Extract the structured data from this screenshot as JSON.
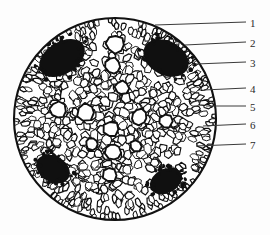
{
  "figure": {
    "kind": "botanical-cross-section",
    "background_color": "#fdfdfd",
    "ink_color": "#111111",
    "cell_fill_color": "#ffffff",
    "patch_fill_color": "#101010",
    "outline": {
      "center_x": 115,
      "center_y": 119,
      "radius": 101
    }
  },
  "labels": [
    {
      "id": "1",
      "text": "1",
      "text_x": 250,
      "text_y": 18,
      "leader_x1": 155,
      "leader_y1": 25,
      "leader_x2": 246,
      "leader_y2": 22
    },
    {
      "id": "2",
      "text": "2",
      "text_x": 250,
      "text_y": 38,
      "leader_x1": 185,
      "leader_y1": 45,
      "leader_x2": 246,
      "leader_y2": 42
    },
    {
      "id": "3",
      "text": "3",
      "text_x": 250,
      "text_y": 58,
      "leader_x1": 196,
      "leader_y1": 64,
      "leader_x2": 246,
      "leader_y2": 62
    },
    {
      "id": "4",
      "text": "4",
      "text_x": 250,
      "text_y": 84,
      "leader_x1": 204,
      "leader_y1": 90,
      "leader_x2": 246,
      "leader_y2": 88
    },
    {
      "id": "5",
      "text": "5",
      "text_x": 250,
      "text_y": 102,
      "leader_x1": 206,
      "leader_y1": 106,
      "leader_x2": 246,
      "leader_y2": 106
    },
    {
      "id": "6",
      "text": "6",
      "text_x": 250,
      "text_y": 120,
      "leader_x1": 203,
      "leader_y1": 126,
      "leader_x2": 246,
      "leader_y2": 124
    },
    {
      "id": "7",
      "text": "7",
      "text_x": 250,
      "text_y": 140,
      "leader_x1": 196,
      "leader_y1": 146,
      "leader_x2": 246,
      "leader_y2": 144
    }
  ],
  "dark_patches": [
    {
      "name": "sclerenchyma-patch-top-left",
      "cx": 62,
      "cy": 58,
      "rx": 25,
      "ry": 16,
      "rotate": -32
    },
    {
      "name": "sclerenchyma-patch-top-right",
      "cx": 166,
      "cy": 58,
      "rx": 24,
      "ry": 17,
      "rotate": 28
    },
    {
      "name": "sclerenchyma-patch-bottom-left",
      "cx": 53,
      "cy": 169,
      "rx": 18,
      "ry": 13,
      "rotate": 30
    },
    {
      "name": "sclerenchyma-patch-bottom-right",
      "cx": 166,
      "cy": 181,
      "rx": 17,
      "ry": 12,
      "rotate": -28
    }
  ],
  "cell_zones": [
    {
      "name": "epidermis-ring",
      "r_inner": 0.9,
      "r_outer": 1.0,
      "cells": 150,
      "size": 5.4,
      "radial": true
    },
    {
      "name": "outer-cortex-ring",
      "r_inner": 0.78,
      "r_outer": 0.9,
      "cells": 135,
      "size": 6.2,
      "radial": true
    },
    {
      "name": "mid-cortex",
      "r_inner": 0.52,
      "r_outer": 0.78,
      "cells": 230,
      "size": 7.0,
      "radial": false
    },
    {
      "name": "inner-cortex",
      "r_inner": 0.26,
      "r_outer": 0.52,
      "cells": 170,
      "size": 7.5,
      "radial": false
    },
    {
      "name": "central-pith",
      "r_inner": 0.0,
      "r_outer": 0.26,
      "cells": 70,
      "size": 8.5,
      "radial": false
    }
  ],
  "large_vessels": [
    {
      "cx": 115,
      "cy": 44,
      "r": 9
    },
    {
      "cx": 113,
      "cy": 66,
      "r": 8
    },
    {
      "cx": 122,
      "cy": 88,
      "r": 7
    },
    {
      "cx": 58,
      "cy": 110,
      "r": 8
    },
    {
      "cx": 86,
      "cy": 112,
      "r": 9
    },
    {
      "cx": 139,
      "cy": 117,
      "r": 8
    },
    {
      "cx": 166,
      "cy": 121,
      "r": 7
    },
    {
      "cx": 111,
      "cy": 129,
      "r": 8
    },
    {
      "cx": 113,
      "cy": 152,
      "r": 8
    },
    {
      "cx": 110,
      "cy": 175,
      "r": 7
    },
    {
      "cx": 92,
      "cy": 144,
      "r": 6
    },
    {
      "cx": 136,
      "cy": 146,
      "r": 6
    }
  ]
}
